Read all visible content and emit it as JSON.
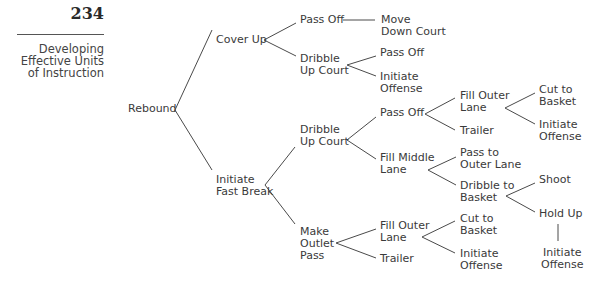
{
  "header": {
    "page_number": "234",
    "section_title_lines": [
      "Developing",
      "Effective Units",
      "of Instruction"
    ]
  },
  "tree": {
    "root": "Rebound",
    "nodes": {
      "rebound": [
        "Rebound"
      ],
      "cover_up": [
        "Cover Up"
      ],
      "cu_pass_off": [
        "Pass Off"
      ],
      "cu_move_down_court": [
        "Move",
        "Down Court"
      ],
      "cu_dribble_up_court": [
        "Dribble",
        "Up Court"
      ],
      "cu_duc_pass_off": [
        "Pass Off"
      ],
      "cu_duc_initiate_offense": [
        "Initiate",
        "Offense"
      ],
      "initiate_fast_break": [
        "Initiate",
        "Fast Break"
      ],
      "fb_dribble_up_court": [
        "Dribble",
        "Up Court"
      ],
      "fb_duc_pass_off": [
        "Pass Off"
      ],
      "fb_po_fill_outer_lane": [
        "Fill Outer",
        "Lane"
      ],
      "fb_po_fol_cut_to_basket": [
        "Cut to",
        "Basket"
      ],
      "fb_po_fol_initiate_offense": [
        "Initiate",
        "Offense"
      ],
      "fb_po_trailer": [
        "Trailer"
      ],
      "fb_fill_middle_lane": [
        "Fill Middle",
        "Lane"
      ],
      "fb_fml_pass_to_outer_lane": [
        "Pass to",
        "Outer Lane"
      ],
      "fb_fml_dribble_to_basket": [
        "Dribble to",
        "Basket"
      ],
      "fb_dtb_shoot": [
        "Shoot"
      ],
      "fb_dtb_hold_up": [
        "Hold Up"
      ],
      "fb_hu_initiate_offense": [
        "Initiate",
        "Offense"
      ],
      "fb_make_outlet_pass": [
        "Make",
        "Outlet",
        "Pass"
      ],
      "fb_mop_fill_outer_lane": [
        "Fill Outer",
        "Lane"
      ],
      "fb_mop_fol_cut_to_basket": [
        "Cut to",
        "Basket"
      ],
      "fb_mop_fol_initiate_offense": [
        "Initiate",
        "Offense"
      ],
      "fb_mop_trailer": [
        "Trailer"
      ]
    }
  },
  "colors": {
    "text": "#3a3a3a",
    "line": "#4a4a4a"
  }
}
